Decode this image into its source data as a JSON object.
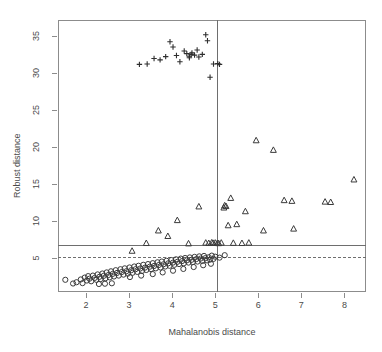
{
  "chart_data": {
    "type": "scatter",
    "title": "",
    "xlabel": "Mahalanobis distance",
    "ylabel": "Robust distance",
    "xlim": [
      1.35,
      8.5
    ],
    "ylim": [
      0.4,
      37.2
    ],
    "xticks": [
      2,
      3,
      4,
      5,
      6,
      7,
      8
    ],
    "yticks": [
      5,
      10,
      15,
      20,
      25,
      30,
      35
    ],
    "xticklabels": [
      "2",
      "3",
      "4",
      "5",
      "6",
      "7",
      "8"
    ],
    "yticklabels": [
      "5",
      "10",
      "15",
      "20",
      "25",
      "30",
      "35"
    ],
    "grid": false,
    "legend": null,
    "reference_lines": [
      {
        "name": "robust-cutoff-solid",
        "orientation": "horizontal",
        "value": 6.8,
        "style": "solid"
      },
      {
        "name": "chi-square-cutoff-dashed",
        "orientation": "horizontal",
        "value": 5.1,
        "style": "dashed"
      },
      {
        "name": "mahalanobis-cutoff-vertical",
        "orientation": "vertical",
        "value": 5.05,
        "style": "solid"
      }
    ],
    "series": [
      {
        "name": "regular-observations",
        "marker": "circle",
        "points": [
          [
            1.52,
            2.05
          ],
          [
            1.7,
            1.55
          ],
          [
            1.78,
            1.72
          ],
          [
            1.88,
            2.1
          ],
          [
            1.92,
            1.6
          ],
          [
            1.97,
            2.35
          ],
          [
            2.02,
            1.95
          ],
          [
            2.05,
            2.55
          ],
          [
            2.08,
            2.2
          ],
          [
            2.12,
            1.85
          ],
          [
            2.16,
            2.62
          ],
          [
            2.2,
            2.3
          ],
          [
            2.24,
            2.05
          ],
          [
            2.27,
            2.78
          ],
          [
            2.31,
            2.45
          ],
          [
            2.34,
            2.15
          ],
          [
            2.38,
            2.9
          ],
          [
            2.41,
            2.58
          ],
          [
            2.45,
            2.25
          ],
          [
            2.48,
            3.05
          ],
          [
            2.52,
            2.7
          ],
          [
            2.55,
            2.38
          ],
          [
            2.58,
            3.2
          ],
          [
            2.62,
            2.85
          ],
          [
            2.65,
            2.5
          ],
          [
            2.69,
            3.35
          ],
          [
            2.72,
            2.98
          ],
          [
            2.76,
            2.62
          ],
          [
            2.8,
            3.48
          ],
          [
            2.83,
            3.1
          ],
          [
            2.87,
            2.75
          ],
          [
            2.9,
            3.6
          ],
          [
            2.94,
            3.22
          ],
          [
            2.97,
            2.88
          ],
          [
            3.01,
            3.72
          ],
          [
            3.05,
            3.35
          ],
          [
            3.08,
            3.0
          ],
          [
            3.12,
            3.85
          ],
          [
            3.15,
            3.48
          ],
          [
            3.19,
            3.12
          ],
          [
            3.22,
            3.95
          ],
          [
            3.26,
            3.58
          ],
          [
            3.3,
            3.25
          ],
          [
            3.33,
            4.08
          ],
          [
            3.37,
            3.7
          ],
          [
            3.4,
            3.38
          ],
          [
            3.44,
            4.18
          ],
          [
            3.48,
            3.82
          ],
          [
            3.51,
            3.5
          ],
          [
            3.55,
            4.3
          ],
          [
            3.58,
            3.92
          ],
          [
            3.62,
            3.6
          ],
          [
            3.66,
            4.42
          ],
          [
            3.69,
            4.05
          ],
          [
            3.73,
            3.72
          ],
          [
            3.76,
            4.52
          ],
          [
            3.8,
            4.15
          ],
          [
            3.84,
            3.85
          ],
          [
            3.87,
            4.62
          ],
          [
            3.91,
            4.28
          ],
          [
            3.94,
            3.95
          ],
          [
            3.98,
            4.72
          ],
          [
            4.02,
            4.38
          ],
          [
            4.05,
            4.08
          ],
          [
            4.09,
            4.82
          ],
          [
            4.12,
            4.48
          ],
          [
            4.16,
            4.18
          ],
          [
            4.2,
            4.92
          ],
          [
            4.23,
            4.58
          ],
          [
            4.27,
            4.28
          ],
          [
            4.3,
            5.0
          ],
          [
            4.34,
            4.68
          ],
          [
            4.38,
            4.38
          ],
          [
            4.41,
            5.08
          ],
          [
            4.45,
            4.75
          ],
          [
            4.48,
            4.45
          ],
          [
            4.52,
            5.15
          ],
          [
            4.56,
            4.85
          ],
          [
            4.59,
            4.52
          ],
          [
            4.63,
            5.22
          ],
          [
            4.66,
            4.92
          ],
          [
            4.7,
            4.6
          ],
          [
            4.74,
            5.28
          ],
          [
            4.77,
            4.98
          ],
          [
            4.81,
            4.68
          ],
          [
            4.85,
            5.1
          ],
          [
            4.88,
            4.78
          ],
          [
            4.92,
            5.32
          ],
          [
            4.96,
            4.88
          ],
          [
            5.0,
            5.18
          ],
          [
            5.1,
            5.05
          ],
          [
            5.22,
            5.38
          ],
          [
            2.3,
            1.48
          ],
          [
            2.44,
            1.52
          ],
          [
            2.6,
            1.58
          ],
          [
            3.02,
            2.42
          ],
          [
            3.28,
            2.62
          ],
          [
            3.55,
            2.82
          ],
          [
            3.78,
            3.05
          ],
          [
            4.02,
            3.28
          ],
          [
            4.26,
            3.52
          ],
          [
            4.5,
            3.78
          ],
          [
            4.72,
            4.02
          ],
          [
            4.9,
            4.22
          ]
        ]
      },
      {
        "name": "moderate-outliers",
        "marker": "triangle",
        "points": [
          [
            3.07,
            5.95
          ],
          [
            3.4,
            7.0
          ],
          [
            3.68,
            8.7
          ],
          [
            3.9,
            7.95
          ],
          [
            4.12,
            10.1
          ],
          [
            4.38,
            6.95
          ],
          [
            4.62,
            11.95
          ],
          [
            4.78,
            7.05
          ],
          [
            4.85,
            7.0
          ],
          [
            4.92,
            7.08
          ],
          [
            5.0,
            7.05
          ],
          [
            5.08,
            6.98
          ],
          [
            5.14,
            7.05
          ],
          [
            5.2,
            11.8
          ],
          [
            5.22,
            12.1
          ],
          [
            5.25,
            12.0
          ],
          [
            5.3,
            9.4
          ],
          [
            5.36,
            13.1
          ],
          [
            5.42,
            7.02
          ],
          [
            5.5,
            9.55
          ],
          [
            5.62,
            7.0
          ],
          [
            5.7,
            11.3
          ],
          [
            5.78,
            7.05
          ],
          [
            5.95,
            20.9
          ],
          [
            6.12,
            8.7
          ],
          [
            6.35,
            19.6
          ],
          [
            6.6,
            12.8
          ],
          [
            6.78,
            12.7
          ],
          [
            6.82,
            8.95
          ],
          [
            7.55,
            12.6
          ],
          [
            7.68,
            12.55
          ],
          [
            8.22,
            15.6
          ],
          [
            4.95,
            7.02
          ],
          [
            5.05,
            7.0
          ]
        ]
      },
      {
        "name": "severe-outliers",
        "marker": "plus",
        "points": [
          [
            3.24,
            31.2
          ],
          [
            3.42,
            31.25
          ],
          [
            3.58,
            32.0
          ],
          [
            3.72,
            31.8
          ],
          [
            3.85,
            32.25
          ],
          [
            3.95,
            34.25
          ],
          [
            4.02,
            33.55
          ],
          [
            4.1,
            32.4
          ],
          [
            4.18,
            31.55
          ],
          [
            4.28,
            33.0
          ],
          [
            4.34,
            32.65
          ],
          [
            4.4,
            32.3
          ],
          [
            4.44,
            32.55
          ],
          [
            4.46,
            32.75
          ],
          [
            4.52,
            32.45
          ],
          [
            4.58,
            33.15
          ],
          [
            4.62,
            32.2
          ],
          [
            4.7,
            32.55
          ],
          [
            4.78,
            35.2
          ],
          [
            4.82,
            34.4
          ],
          [
            4.88,
            29.45
          ],
          [
            4.96,
            31.25
          ],
          [
            5.06,
            31.3
          ],
          [
            5.1,
            31.2
          ],
          [
            4.4,
            32.1
          ]
        ]
      }
    ]
  }
}
